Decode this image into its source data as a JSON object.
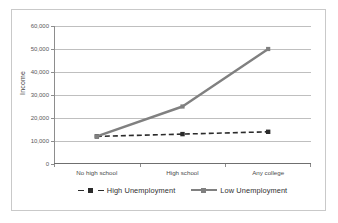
{
  "chart_data": {
    "type": "line",
    "title": "",
    "xlabel": "",
    "ylabel": "Income",
    "categories": [
      "No high school",
      "High school",
      "Any college"
    ],
    "series": [
      {
        "name": "High Unemployment",
        "values": [
          12000,
          13000,
          14000
        ],
        "style": "dashed",
        "marker": "square",
        "color": "#2b2b2b"
      },
      {
        "name": "Low Unemployment",
        "values": [
          12000,
          25000,
          50000
        ],
        "style": "solid",
        "marker": "square",
        "color": "#808080"
      }
    ],
    "ylim": [
      0,
      60000
    ],
    "ytick_labels": [
      "0",
      "10,000",
      "20,000",
      "30,000",
      "40,000",
      "50,000",
      "60,000"
    ],
    "ytick_values": [
      0,
      10000,
      20000,
      30000,
      40000,
      50000,
      60000
    ],
    "grid": true,
    "legend_position": "bottom"
  },
  "axis": {
    "y_title": "Income",
    "ticks": [
      {
        "label": "60,000",
        "value": 60000
      },
      {
        "label": "50,000",
        "value": 50000
      },
      {
        "label": "40,000",
        "value": 40000
      },
      {
        "label": "30,000",
        "value": 30000
      },
      {
        "label": "20,000",
        "value": 20000
      },
      {
        "label": "10,000",
        "value": 10000
      },
      {
        "label": "0",
        "value": 0
      }
    ]
  },
  "categories": [
    {
      "label": "No high school"
    },
    {
      "label": "High school"
    },
    {
      "label": "Any college"
    }
  ],
  "legend": [
    {
      "label": "High Unemployment"
    },
    {
      "label": "Low Unemployment"
    }
  ],
  "colors": {
    "high_unemployment": "#2b2b2b",
    "low_unemployment": "#808080",
    "gridline": "#bfbfbf",
    "axis": "#8d8d8d",
    "frame": "#c9c9c9",
    "tick_text": "#595959"
  }
}
